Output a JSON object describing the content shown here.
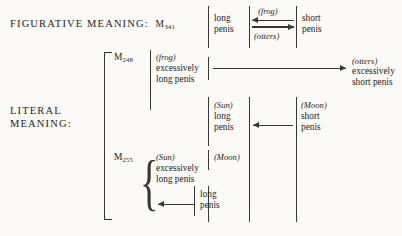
{
  "figure": {
    "type": "structural-opposition-diagram",
    "rows": {
      "figurative": {
        "label": "FIGURATIVE MEANING:",
        "myth_label": "M",
        "myth_number": "341",
        "left_cell": "long\npenis",
        "left_cell_line1": "long",
        "left_cell_line2": "penis",
        "right_cell_line1": "short",
        "right_cell_line2": "penis",
        "arrow_top_label": "(frog)",
        "arrow_top_direction": "left",
        "arrow_bottom_label": "(otters)",
        "arrow_bottom_direction": "right"
      },
      "literal": {
        "label": "LITERAL\nMEANING:",
        "label_line1": "LITERAL",
        "label_line2": "MEANING:"
      },
      "m248": {
        "myth_label": "M",
        "myth_number": "248",
        "source_agent": "(frog)",
        "source_line1": "excessively",
        "source_line2": "long penis",
        "arrow_direction": "right",
        "target_agent": "(otters)",
        "target_line1": "excessively",
        "target_line2": "short penis"
      },
      "sun_moon": {
        "left_agent": "(Sun)",
        "left_line1": "long",
        "left_line2": "penis",
        "right_agent": "(Moon)",
        "right_line1": "short",
        "right_line2": "penis",
        "arrow_direction": "left"
      },
      "m255": {
        "myth_label": "M",
        "myth_number": "255",
        "left_agent": "(Sun)",
        "left_line1": "excessively",
        "left_line2": "long penis",
        "right_agent": "(Moon)",
        "bottom_line1": "long",
        "bottom_line2": "penis",
        "arrow_direction": "left"
      }
    }
  }
}
